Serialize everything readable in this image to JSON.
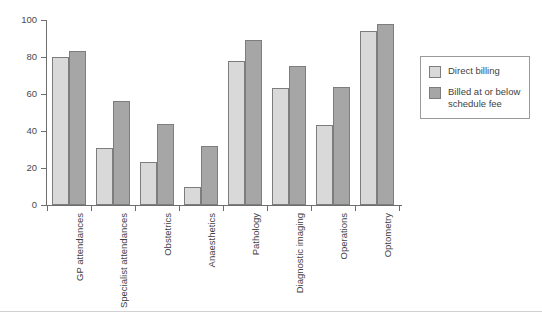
{
  "chart_data": {
    "type": "bar",
    "title": "",
    "subtitle": "",
    "xlabel": "",
    "ylabel": "",
    "ylim": [
      0,
      100
    ],
    "yticks": [
      0,
      20,
      40,
      60,
      80,
      100
    ],
    "grid": false,
    "legend_position": "right",
    "categories": [
      "GP attendances",
      "Specialist attendances",
      "Obstetrics",
      "Anaesthetics",
      "Pathology",
      "Diagnostic imaging",
      "Operations",
      "Optometry"
    ],
    "series": [
      {
        "name": "Direct billing",
        "color": "#d9d9d9",
        "values": [
          80,
          31,
          23,
          10,
          78,
          63,
          43,
          94
        ]
      },
      {
        "name": "Billed at or below schedule fee",
        "color": "#a6a6a6",
        "values": [
          83,
          56,
          44,
          32,
          89,
          75,
          64,
          98
        ]
      }
    ]
  },
  "axes": {
    "y_tick_labels": [
      "0",
      "20",
      "40",
      "60",
      "80",
      "100"
    ],
    "axis_color": "#6e6e6e"
  },
  "legend": {
    "items": [
      {
        "label": "Direct billing",
        "swatch": "light"
      },
      {
        "label": "Billed at or below schedule fee",
        "swatch": "dark"
      }
    ]
  }
}
